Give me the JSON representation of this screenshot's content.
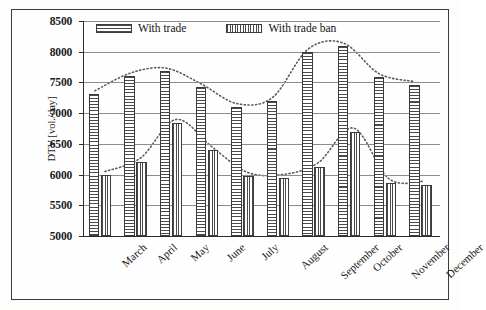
{
  "chart_data": {
    "type": "bar",
    "title": "",
    "xlabel": "",
    "ylabel": "DTV [vol./day]",
    "ylim": [
      5000,
      8500
    ],
    "ytick_step": 500,
    "yticks": [
      5000,
      5500,
      6000,
      6500,
      7000,
      7500,
      8000,
      8500
    ],
    "grid": true,
    "legend_position": "top-center-inside",
    "categories": [
      "March",
      "April",
      "May",
      "June",
      "July",
      "August",
      "September",
      "October",
      "November",
      "December"
    ],
    "series": [
      {
        "name": "With trade",
        "pattern": "horizontal-hatch",
        "values": [
          7310,
          7600,
          7680,
          7420,
          7100,
          7200,
          7990,
          8090,
          7590,
          7460
        ],
        "trendline": "dotted-smooth"
      },
      {
        "name": "With trade ban",
        "pattern": "vertical-hatch",
        "values": [
          5990,
          6210,
          6840,
          6400,
          5980,
          5940,
          6130,
          6700,
          5870,
          5830
        ],
        "trendline": "dotted-smooth"
      }
    ]
  },
  "legend": {
    "items": [
      {
        "label": "With trade",
        "swatch": "horizontal-hatch-swatch"
      },
      {
        "label": "With trade ban",
        "swatch": "vertical-hatch-swatch"
      }
    ]
  },
  "axis": {
    "y_title": "DTV [vol./day]",
    "y_tick_labels": [
      "8500",
      "8000",
      "7500",
      "7000",
      "6500",
      "6000",
      "5500",
      "5000"
    ],
    "x_tick_labels": [
      "March",
      "April",
      "May",
      "June",
      "July",
      "August",
      "September",
      "October",
      "November",
      "December"
    ]
  },
  "colors": {
    "frame": "#3a3a3a",
    "axis": "#2e2e2e",
    "gridline": "#8d8d8d",
    "hatch": "#4a4a4a",
    "background": "#fefefe",
    "trendline": "#5a5a5a"
  }
}
